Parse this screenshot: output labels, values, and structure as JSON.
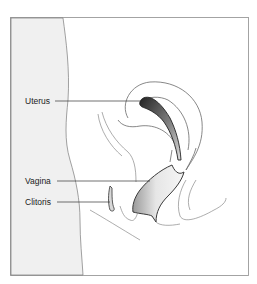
{
  "figure": {
    "type": "anatomical-diagram",
    "view": "sagittal section",
    "labels": [
      {
        "id": "uterus",
        "text": "Uterus"
      },
      {
        "id": "vagina",
        "text": "Vagina"
      },
      {
        "id": "clitoris",
        "text": "Clitoris"
      }
    ]
  },
  "colors": {
    "background": "#ffffff",
    "frame": "#9a9a9a",
    "body_region": "#f0f0f0",
    "outline": "#6a6a6a",
    "organ_dark": "#333333",
    "organ_shade": "#c8c8c8",
    "label_text": "#222222"
  }
}
